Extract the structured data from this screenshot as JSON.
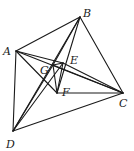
{
  "diagram": {
    "type": "geometry-figure",
    "points": {
      "A": {
        "label": "A"
      },
      "B": {
        "label": "B"
      },
      "C": {
        "label": "C"
      },
      "D": {
        "label": "D"
      },
      "E": {
        "label": "E"
      },
      "F": {
        "label": "F"
      },
      "G": {
        "label": "G"
      }
    },
    "segments": [
      [
        "A",
        "B"
      ],
      [
        "B",
        "C"
      ],
      [
        "A",
        "D"
      ],
      [
        "D",
        "C"
      ],
      [
        "A",
        "C"
      ],
      [
        "A",
        "F"
      ],
      [
        "A",
        "E"
      ],
      [
        "F",
        "C"
      ],
      [
        "G",
        "F"
      ],
      [
        "E",
        "F"
      ],
      [
        "B",
        "G"
      ],
      [
        "B",
        "D"
      ],
      [
        "B",
        "F"
      ],
      [
        "D",
        "E"
      ],
      [
        "D",
        "G"
      ],
      [
        "G",
        "E"
      ],
      [
        "G",
        "C"
      ],
      [
        "E",
        "C"
      ]
    ],
    "line_color": "#1a1a1a",
    "background": "#ffffff"
  }
}
